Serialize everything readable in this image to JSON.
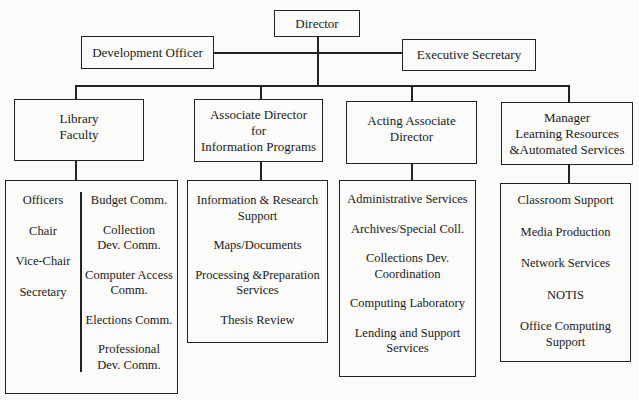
{
  "chart": {
    "root": {
      "label": "Director"
    },
    "staff": [
      {
        "label": "Development Officer"
      },
      {
        "label": "Executive Secretary"
      }
    ],
    "divisions": [
      {
        "label": "Library\nFaculty",
        "columns": [
          {
            "items": [
              "Officers",
              "Chair",
              "Vice-Chair",
              "Secretary"
            ]
          },
          {
            "items": [
              "Budget Comm.",
              "Collection\nDev. Comm.",
              "Computer Access\nComm.",
              "Elections Comm.",
              "Professional\nDev. Comm."
            ]
          }
        ]
      },
      {
        "label": "Associate Director\nfor\nInformation Programs",
        "items": [
          "Information & Research\nSupport",
          "Maps/Documents",
          "Processing &Preparation\nServices",
          "Thesis Review"
        ]
      },
      {
        "label": "Acting Associate\nDirector",
        "items": [
          "Administrative Services",
          "Archives/Special Coll.",
          "Collections Dev.\nCoordination",
          "Computing Laboratory",
          "Lending and Support\nServices"
        ]
      },
      {
        "label": "Manager\nLearning Resources\n&Automated Services",
        "items": [
          "Classroom Support",
          "Media Production",
          "Network Services",
          "NOTIS",
          "Office Computing\nSupport"
        ]
      }
    ]
  }
}
